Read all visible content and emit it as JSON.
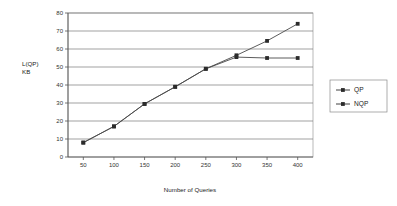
{
  "chart_data": {
    "type": "line",
    "title": "",
    "subtitle": "",
    "xlabel": "Number of Queries",
    "ylabel": "L(QP)\nKB",
    "ylabel_line1": "L(QP)",
    "ylabel_line2": "KB",
    "x": [
      50,
      100,
      150,
      200,
      250,
      300,
      350,
      400
    ],
    "xtick_labels": [
      "50",
      "100",
      "150",
      "200",
      "250",
      "300",
      "350",
      "400"
    ],
    "ytick_labels": [
      "0",
      "10",
      "20",
      "30",
      "40",
      "50",
      "60",
      "70",
      "80"
    ],
    "yticks": [
      0,
      10,
      20,
      30,
      40,
      50,
      60,
      70,
      80
    ],
    "xlim": [
      25,
      425
    ],
    "ylim": [
      0,
      80
    ],
    "grid": "horizontal",
    "legend_position": "right",
    "series": [
      {
        "name": "QP",
        "marker": "square",
        "color": "#2b2b2b",
        "values": [
          8,
          17,
          29.5,
          39,
          49,
          55.5,
          55,
          55
        ]
      },
      {
        "name": "NQP",
        "marker": "square",
        "color": "#2b2b2b",
        "values": [
          8,
          17,
          29.5,
          39,
          49,
          56.5,
          64.5,
          74
        ]
      }
    ]
  },
  "legend": {
    "items": [
      {
        "label": "QP"
      },
      {
        "label": "NQP"
      }
    ]
  }
}
